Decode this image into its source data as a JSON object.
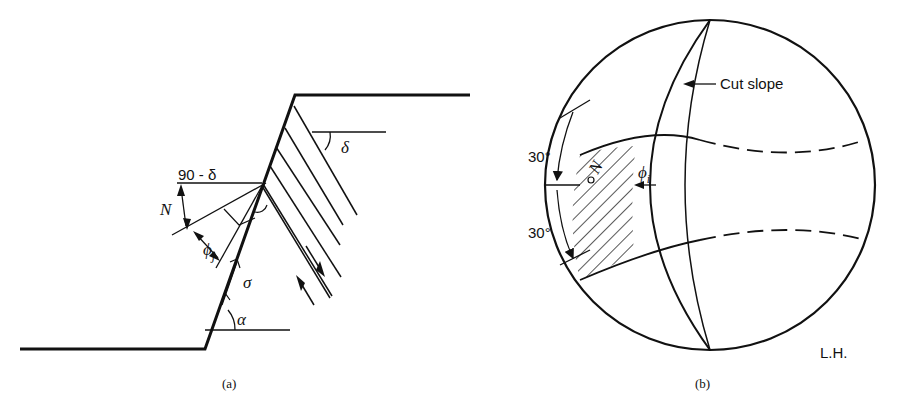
{
  "figure_a": {
    "caption": "(a)",
    "labels": {
      "delta": "δ",
      "ninety_minus_delta": "90 - δ",
      "normal": "N",
      "phi_j": "ϕ",
      "phi_j_sub": "j",
      "sigma": "σ",
      "alpha": "α"
    }
  },
  "figure_b": {
    "caption": "(b)",
    "labels": {
      "cut_slope": "Cut slope",
      "angle_upper": "30°",
      "angle_lower": "30°",
      "normal": "N",
      "phi_i": "ϕ",
      "phi_i_sub": "i",
      "hemisphere": "L.H."
    }
  },
  "colors": {
    "line": "#111111",
    "background": "#ffffff"
  }
}
